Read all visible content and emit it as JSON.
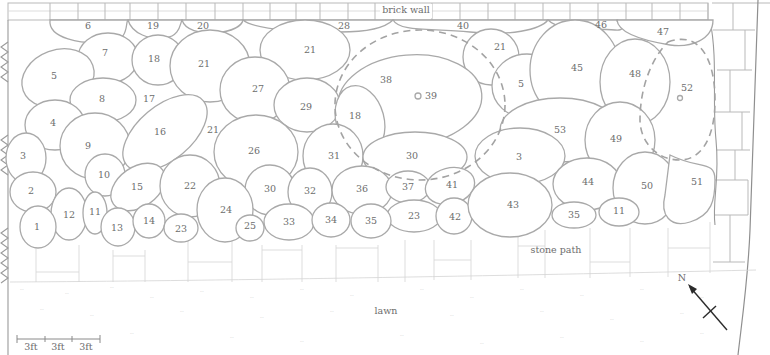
{
  "diagram": {
    "type": "garden planting plan",
    "labels": {
      "brick_wall": "brick wall",
      "stone_path": "stone path",
      "lawn": "lawn",
      "north": "N"
    },
    "scale_bar": {
      "segments": [
        "3ft",
        "3ft",
        "3ft"
      ]
    },
    "colors": {
      "outline": "#a9a9a9",
      "text": "#6e6e6e",
      "arrow": "#2b2b2b",
      "background": "#ffffff"
    },
    "plant_beds": [
      {
        "id": "6",
        "x": 88,
        "y": 26
      },
      {
        "id": "19",
        "x": 153,
        "y": 26
      },
      {
        "id": "20",
        "x": 203,
        "y": 26
      },
      {
        "id": "28",
        "x": 344,
        "y": 26
      },
      {
        "id": "40",
        "x": 463,
        "y": 26
      },
      {
        "id": "46",
        "x": 601,
        "y": 25
      },
      {
        "id": "47",
        "x": 663,
        "y": 32
      },
      {
        "id": "7",
        "x": 105,
        "y": 53
      },
      {
        "id": "18",
        "x": 154,
        "y": 59
      },
      {
        "id": "21",
        "x": 204,
        "y": 64
      },
      {
        "id": "21",
        "x": 310,
        "y": 50
      },
      {
        "id": "21",
        "x": 500,
        "y": 47
      },
      {
        "id": "5",
        "x": 54,
        "y": 76
      },
      {
        "id": "8",
        "x": 102,
        "y": 99
      },
      {
        "id": "17",
        "x": 149,
        "y": 99
      },
      {
        "id": "27",
        "x": 258,
        "y": 89
      },
      {
        "id": "29",
        "x": 306,
        "y": 107
      },
      {
        "id": "38",
        "x": 386,
        "y": 80
      },
      {
        "id": "39",
        "x": 431,
        "y": 96
      },
      {
        "id": "5",
        "x": 521,
        "y": 84
      },
      {
        "id": "45",
        "x": 577,
        "y": 68
      },
      {
        "id": "48",
        "x": 635,
        "y": 74
      },
      {
        "id": "52",
        "x": 687,
        "y": 88
      },
      {
        "id": "4",
        "x": 53,
        "y": 123
      },
      {
        "id": "9",
        "x": 88,
        "y": 146
      },
      {
        "id": "16",
        "x": 160,
        "y": 132
      },
      {
        "id": "21",
        "x": 213,
        "y": 130
      },
      {
        "id": "18",
        "x": 355,
        "y": 116
      },
      {
        "id": "53",
        "x": 560,
        "y": 130
      },
      {
        "id": "49",
        "x": 616,
        "y": 139
      },
      {
        "id": "3",
        "x": 23,
        "y": 156
      },
      {
        "id": "26",
        "x": 254,
        "y": 151
      },
      {
        "id": "31",
        "x": 334,
        "y": 156
      },
      {
        "id": "30",
        "x": 412,
        "y": 156
      },
      {
        "id": "3",
        "x": 519,
        "y": 157
      },
      {
        "id": "10",
        "x": 104,
        "y": 175
      },
      {
        "id": "15",
        "x": 137,
        "y": 187
      },
      {
        "id": "22",
        "x": 190,
        "y": 186
      },
      {
        "id": "2",
        "x": 31,
        "y": 191
      },
      {
        "id": "30",
        "x": 270,
        "y": 189
      },
      {
        "id": "32",
        "x": 310,
        "y": 191
      },
      {
        "id": "36",
        "x": 362,
        "y": 189
      },
      {
        "id": "37",
        "x": 408,
        "y": 187
      },
      {
        "id": "41",
        "x": 452,
        "y": 185
      },
      {
        "id": "44",
        "x": 588,
        "y": 182
      },
      {
        "id": "50",
        "x": 647,
        "y": 186
      },
      {
        "id": "51",
        "x": 697,
        "y": 182
      },
      {
        "id": "12",
        "x": 69,
        "y": 215
      },
      {
        "id": "11",
        "x": 95,
        "y": 212
      },
      {
        "id": "24",
        "x": 226,
        "y": 210
      },
      {
        "id": "23",
        "x": 414,
        "y": 216
      },
      {
        "id": "42",
        "x": 455,
        "y": 217
      },
      {
        "id": "43",
        "x": 513,
        "y": 205
      },
      {
        "id": "35",
        "x": 574,
        "y": 215
      },
      {
        "id": "11",
        "x": 619,
        "y": 211
      },
      {
        "id": "1",
        "x": 37,
        "y": 227
      },
      {
        "id": "13",
        "x": 117,
        "y": 228
      },
      {
        "id": "14",
        "x": 149,
        "y": 221
      },
      {
        "id": "23",
        "x": 181,
        "y": 229
      },
      {
        "id": "25",
        "x": 250,
        "y": 226
      },
      {
        "id": "33",
        "x": 289,
        "y": 222
      },
      {
        "id": "34",
        "x": 331,
        "y": 220
      },
      {
        "id": "35",
        "x": 371,
        "y": 221
      }
    ]
  }
}
